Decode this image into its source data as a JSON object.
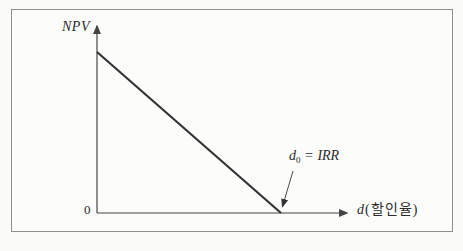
{
  "figure": {
    "labels": {
      "y_axis": "NPV",
      "origin": "0",
      "x_var": "d",
      "x_unit": "(할인율)",
      "annotation_var": "d",
      "annotation_sub": "0",
      "annotation_eq": "=",
      "annotation_val": "IRR"
    },
    "colors": {
      "axis": "#444444",
      "curve": "#333333",
      "annotation_arrow": "#4a4a4a",
      "frame_border": "#8f8f8f"
    }
  },
  "chart_data": {
    "type": "line",
    "title": "",
    "xlabel": "d (할인율)",
    "ylabel": "NPV",
    "series": [
      {
        "name": "NPV(d)",
        "x": [
          0,
          1
        ],
        "y": [
          1,
          0
        ]
      }
    ],
    "x_ticks": [],
    "y_ticks": [],
    "origin_label": "0",
    "annotations": [
      {
        "text": "d₀ = IRR",
        "points_to": {
          "x": 1,
          "y": 0
        },
        "meaning": "x-intercept where NPV = 0"
      }
    ],
    "axis_arrows": true,
    "grid": false,
    "legend": false
  }
}
